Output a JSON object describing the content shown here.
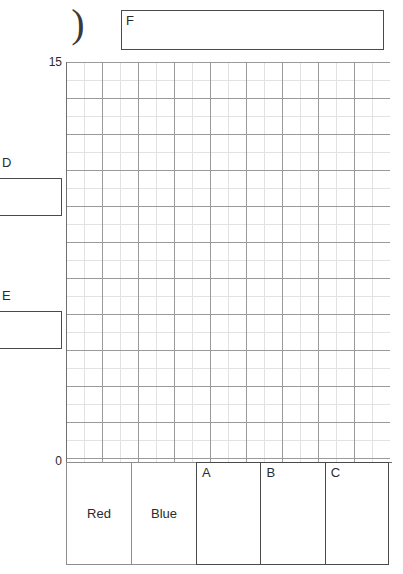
{
  "worksheet": {
    "paren_glyph": ")",
    "answer_boxes": [
      {
        "id": "F",
        "label": "F",
        "value": ""
      },
      {
        "id": "D",
        "label": "D",
        "value": ""
      },
      {
        "id": "E",
        "label": "E",
        "value": ""
      }
    ]
  },
  "chart_data": {
    "type": "bar",
    "title": "",
    "xlabel": "",
    "ylabel": "",
    "categories": [
      "Red",
      "Blue",
      "",
      "",
      ""
    ],
    "values": [
      0,
      0,
      0,
      0,
      0
    ],
    "ylim": [
      0,
      15
    ],
    "ytick_labels": [
      "15",
      "0"
    ],
    "grid": true,
    "legend": "none",
    "axis": {
      "y_top_label": "15",
      "y_bottom_label": "0"
    },
    "grid_spec": {
      "minor_step_px": 18,
      "major_every": 2,
      "columns": 18,
      "rows": 22
    }
  },
  "table": {
    "cells": [
      {
        "name": "red-cell",
        "text": "Red",
        "corner_label": "",
        "style": "thin"
      },
      {
        "name": "blue-cell",
        "text": "Blue",
        "corner_label": "",
        "style": "thin"
      },
      {
        "name": "box-a",
        "text": "",
        "corner_label": "A",
        "style": "thick"
      },
      {
        "name": "box-b",
        "text": "",
        "corner_label": "B",
        "style": "thick"
      },
      {
        "name": "box-c",
        "text": "",
        "corner_label": "C",
        "style": "thick"
      }
    ]
  },
  "colors": {
    "ink": "#2b2b2b",
    "box_border": "#4a4a4a",
    "grid_major": "#9a9a9a",
    "grid_minor": "#e2e2e2",
    "axis": "#6f6f6f"
  }
}
